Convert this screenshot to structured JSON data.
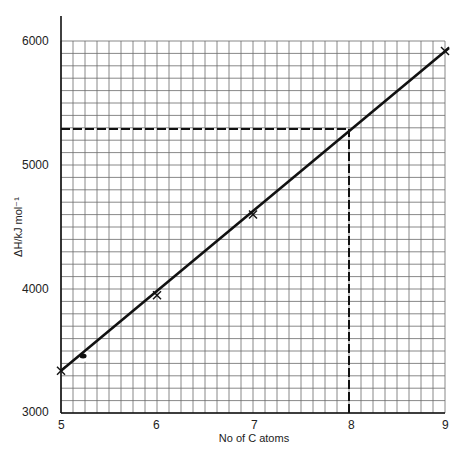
{
  "chart_data": {
    "type": "line",
    "title": "",
    "xlabel": "No of C atoms",
    "ylabel": "ΔH/kJ mol⁻¹",
    "xlim": [
      5,
      9
    ],
    "ylim": [
      3000,
      6000
    ],
    "x_ticks": [
      5,
      6,
      7,
      8,
      9
    ],
    "y_ticks": [
      3000,
      4000,
      5000,
      6000
    ],
    "grid": true,
    "grid_minor": {
      "x_per_unit": 8,
      "y_per_1000": 10
    },
    "series": [
      {
        "name": "measured points",
        "marker": "x",
        "points": [
          {
            "x": 5,
            "y": 3340
          },
          {
            "x": 6,
            "y": 3950
          },
          {
            "x": 7,
            "y": 4600
          },
          {
            "x": 9,
            "y": 5920
          }
        ]
      },
      {
        "name": "best fit line",
        "style": "solid",
        "points": [
          {
            "x": 5,
            "y": 3340
          },
          {
            "x": 9,
            "y": 5920
          }
        ]
      }
    ],
    "annotations": [
      {
        "type": "dashed-vertical",
        "x": 8,
        "from_y": 3000,
        "to_y": 5290
      },
      {
        "type": "dashed-horizontal",
        "y": 5290,
        "from_x": 5,
        "to_x": 8
      },
      {
        "type": "blob",
        "x": 5.23,
        "y": 3460
      }
    ]
  },
  "labels": {
    "xlabel": "No of C atoms",
    "ylabel": "ΔH/kJ mol⁻¹",
    "x_ticks": [
      "5",
      "6",
      "7",
      "8",
      "9"
    ],
    "y_ticks": [
      "3000",
      "4000",
      "5000",
      "6000"
    ]
  }
}
